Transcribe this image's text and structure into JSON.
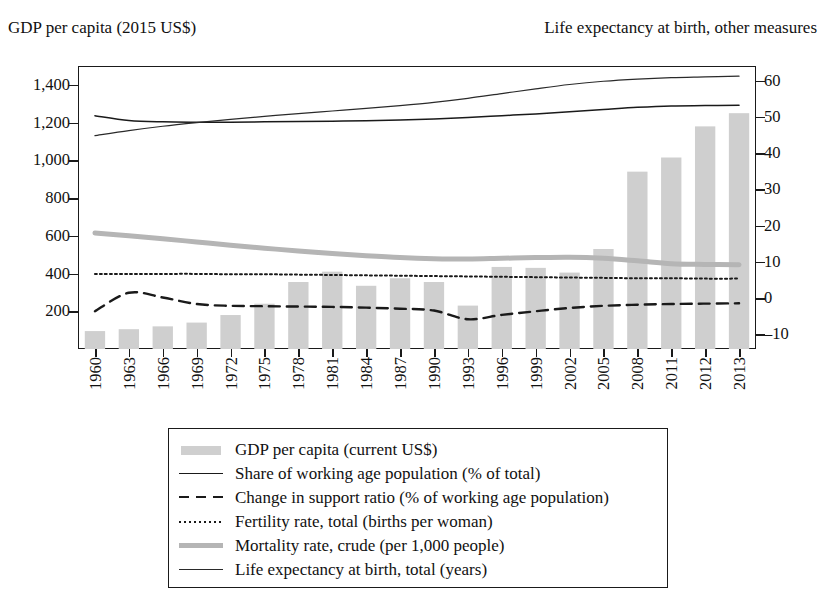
{
  "titles": {
    "left_axis": "GDP per capita (2015 US$)",
    "right_axis": "Life expectancy at birth, other measures"
  },
  "chart_data": {
    "type": "bar",
    "title": "",
    "xlabel": "",
    "ylabel": "GDP per capita (2015 US$)",
    "y2label": "Life expectancy at birth, other measures",
    "grid": false,
    "legend_position": "bottom",
    "ylim": [
      0,
      1500
    ],
    "y2lim": [
      -14,
      64
    ],
    "yticks": [
      200,
      400,
      600,
      800,
      1000,
      1200,
      1400
    ],
    "ytick_labels": [
      "200",
      "400",
      "600",
      "800",
      "1,000",
      "1,200",
      "1,400"
    ],
    "y2ticks": [
      -10,
      0,
      10,
      20,
      30,
      40,
      50,
      60
    ],
    "y2tick_labels": [
      "–10",
      "0",
      "10",
      "20",
      "30",
      "40",
      "50",
      "60"
    ],
    "categories": [
      "1960",
      "1963",
      "1966",
      "1969",
      "1972",
      "1975",
      "1978",
      "1981",
      "1984",
      "1987",
      "1990",
      "1993",
      "1996",
      "1999",
      "2002",
      "2005",
      "2008",
      "2011",
      "2012",
      "2013"
    ],
    "series": [
      {
        "name": "GDP per capita (current US$)",
        "type": "bar",
        "axis": "left",
        "color": "#cfcfcf",
        "values": [
          95,
          105,
          120,
          140,
          180,
          240,
          355,
          410,
          335,
          375,
          355,
          230,
          435,
          430,
          405,
          530,
          940,
          1015,
          1180,
          1250
        ]
      },
      {
        "name": "Share of working age population (% of total)",
        "type": "line",
        "style": "solid",
        "axis": "right",
        "color": "#1a1a1a",
        "values": [
          50.3,
          49.0,
          48.6,
          48.5,
          48.5,
          48.6,
          48.7,
          48.8,
          48.9,
          49.1,
          49.4,
          49.8,
          50.3,
          50.8,
          51.4,
          52.0,
          52.6,
          53.0,
          53.1,
          53.2
        ]
      },
      {
        "name": "Change in support ratio (% of working age population)",
        "type": "line",
        "style": "dashed",
        "axis": "right",
        "color": "#1a1a1a",
        "values": [
          -3.6,
          1.5,
          0.2,
          -1.6,
          -2.1,
          -2.2,
          -2.3,
          -2.4,
          -2.6,
          -2.9,
          -3.4,
          -5.8,
          -4.6,
          -3.6,
          -2.7,
          -2.1,
          -1.8,
          -1.6,
          -1.5,
          -1.4
        ]
      },
      {
        "name": "Fertility rate, total (births per woman)",
        "type": "line",
        "style": "dotted",
        "axis": "right",
        "color": "#1a1a1a",
        "values": [
          6.7,
          6.7,
          6.7,
          6.7,
          6.6,
          6.6,
          6.5,
          6.4,
          6.3,
          6.2,
          6.1,
          6.0,
          5.9,
          5.8,
          5.7,
          5.6,
          5.5,
          5.5,
          5.4,
          5.4
        ]
      },
      {
        "name": "Mortality rate, crude (per 1,000 people)",
        "type": "line",
        "style": "thick",
        "axis": "right",
        "color": "#b5b5b5",
        "values": [
          18.0,
          17.2,
          16.4,
          15.5,
          14.6,
          13.8,
          13.0,
          12.3,
          11.7,
          11.2,
          10.9,
          10.8,
          11.0,
          11.2,
          11.3,
          11.0,
          10.3,
          9.5,
          9.3,
          9.2
        ]
      },
      {
        "name": "Life expectancy at birth, total (years)",
        "type": "line",
        "style": "thin",
        "axis": "right",
        "color": "#2a2a2a",
        "values": [
          44.8,
          46.2,
          47.4,
          48.4,
          49.3,
          50.1,
          50.9,
          51.6,
          52.3,
          53.1,
          54.0,
          55.1,
          56.4,
          57.7,
          58.9,
          59.8,
          60.4,
          60.8,
          61.0,
          61.2
        ]
      }
    ]
  },
  "legend": {
    "items": [
      {
        "label": "GDP per capita (current US$)",
        "key": "bar-swatch"
      },
      {
        "label": "Share of working age population (% of total)",
        "key": "solid-line"
      },
      {
        "label": "Change in support ratio (% of working age population)",
        "key": "dashed-line"
      },
      {
        "label": "Fertility rate, total (births per woman)",
        "key": "dotted-line"
      },
      {
        "label": "Mortality rate, crude (per 1,000 people)",
        "key": "thick-gray-line"
      },
      {
        "label": "Life expectancy at birth, total (years)",
        "key": "thin-line"
      }
    ]
  }
}
